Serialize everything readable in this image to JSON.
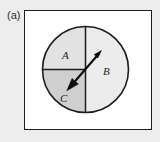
{
  "figure": {
    "panel_label": "(a)",
    "background_color": "#ededed",
    "panel_background_color": "#ffffff",
    "border_color": "#1d1d1d"
  },
  "circle": {
    "center_x": 85.5,
    "center_y": 69.5,
    "radius": 43,
    "outline_color": "#1d1d1d"
  },
  "sectors": [
    {
      "label": "A",
      "position": "upper-left",
      "fill_color": "#e2e2e2",
      "label_x": 62,
      "label_y": 50
    },
    {
      "label": "B",
      "position": "right-half",
      "fill_color": "#ececec",
      "label_x": 103,
      "label_y": 66
    },
    {
      "label": "C",
      "position": "lower-left",
      "fill_color": "#cfcfcf",
      "label_x": 60,
      "label_y": 93
    }
  ],
  "divider_lines": {
    "vertical": {
      "x": 85.5,
      "y_start": 26.5,
      "y_end": 112.5,
      "color": "#1d1d1d"
    },
    "horizontal": {
      "y": 69.5,
      "x_start": 42.5,
      "x_end": 85.5,
      "color": "#1d1d1d"
    }
  },
  "arrow": {
    "type": "double-headed-vector",
    "tail_x": 68,
    "tail_y": 89,
    "tip_x": 101,
    "tip_y": 51,
    "color": "#0d0d0d"
  }
}
